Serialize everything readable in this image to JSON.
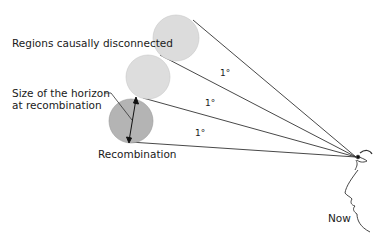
{
  "labels": {
    "disconnected": "Regions causally disconnected",
    "horizon_line1": "Size of the horizon",
    "horizon_line2": "at recombination",
    "recombination": "Recombination",
    "now": "Now"
  },
  "angles": {
    "top": "1°",
    "middle": "1°",
    "bottom": "1°"
  },
  "colors": {
    "light_circle": "#dcdcdc",
    "dark_circle": "#b4b4b4",
    "line": "#333333"
  }
}
